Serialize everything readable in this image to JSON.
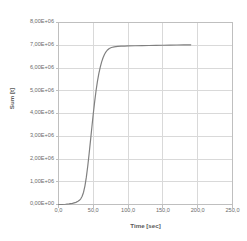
{
  "chart_data": {
    "type": "line",
    "title": "",
    "xlabel": "Time [sec]",
    "ylabel": "Sum [t]",
    "xlim": [
      0,
      250
    ],
    "ylim": [
      0,
      8000000
    ],
    "grid": true,
    "legend": false,
    "legend_position": "none",
    "line_color": "#808080",
    "grid_color": "#d9d9d9",
    "background": "#ffffff",
    "x_tick_labels": [
      "0,0",
      "50,0",
      "100,0",
      "150,0",
      "200,0",
      "250,0"
    ],
    "x_tick_values": [
      0,
      50,
      100,
      150,
      200,
      250
    ],
    "y_tick_labels": [
      "0,00E+00",
      "1,00E+06",
      "2,00E+06",
      "3,00E+06",
      "4,00E+06",
      "5,00E+06",
      "6,00E+06",
      "7,00E+06",
      "8,00E+06"
    ],
    "y_tick_values": [
      0,
      1000000,
      2000000,
      3000000,
      4000000,
      5000000,
      6000000,
      7000000,
      8000000
    ],
    "series": [
      {
        "name": "Sum",
        "x": [
          0,
          5,
          10,
          15,
          20,
          25,
          28,
          30,
          32,
          34,
          36,
          38,
          40,
          42,
          44,
          46,
          48,
          50,
          52,
          54,
          56,
          58,
          60,
          62,
          64,
          66,
          68,
          70,
          73,
          76,
          80,
          85,
          90,
          95,
          100,
          110,
          120,
          130,
          140,
          150,
          160,
          170,
          180,
          190
        ],
        "y": [
          0,
          0,
          10000,
          25000,
          50000,
          95000,
          140000,
          185000,
          250000,
          360000,
          540000,
          820000,
          1200000,
          1680000,
          2230000,
          2820000,
          3420000,
          4000000,
          4530000,
          5010000,
          5420000,
          5760000,
          6040000,
          6270000,
          6450000,
          6590000,
          6700000,
          6780000,
          6860000,
          6900000,
          6930000,
          6950000,
          6960000,
          6965000,
          6970000,
          6978000,
          6985000,
          6990000,
          6995000,
          7000000,
          7005000,
          7010000,
          7015000,
          7020000
        ]
      }
    ]
  }
}
